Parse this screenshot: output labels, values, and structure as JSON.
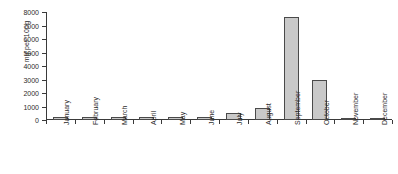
{
  "chart_data": {
    "type": "bar",
    "title": "",
    "subtitle": "",
    "xlabel": "",
    "ylabel": "mg per 100g",
    "categories": [
      "January",
      "February",
      "March",
      "April",
      "May",
      "June",
      "July",
      "August",
      "September",
      "October",
      "November",
      "December"
    ],
    "values": [
      250,
      250,
      200,
      250,
      250,
      250,
      500,
      900,
      7600,
      3000,
      150,
      150
    ],
    "ylim": [
      0,
      8000
    ],
    "yticks": [
      0,
      1000,
      2000,
      3000,
      4000,
      5000,
      6000,
      7000,
      8000
    ],
    "ytick_labels": [
      "0",
      "1000",
      "2000",
      "3000",
      "4000",
      "5000",
      "6000",
      "7000",
      "8000"
    ],
    "grid": false,
    "legend": false,
    "legend_position": "none",
    "bar_fill_color": "#c9c9c9",
    "bar_edge_color": "#4a4a4a",
    "axis_color": "#3a3a3a",
    "background_color": "#ffffff"
  }
}
